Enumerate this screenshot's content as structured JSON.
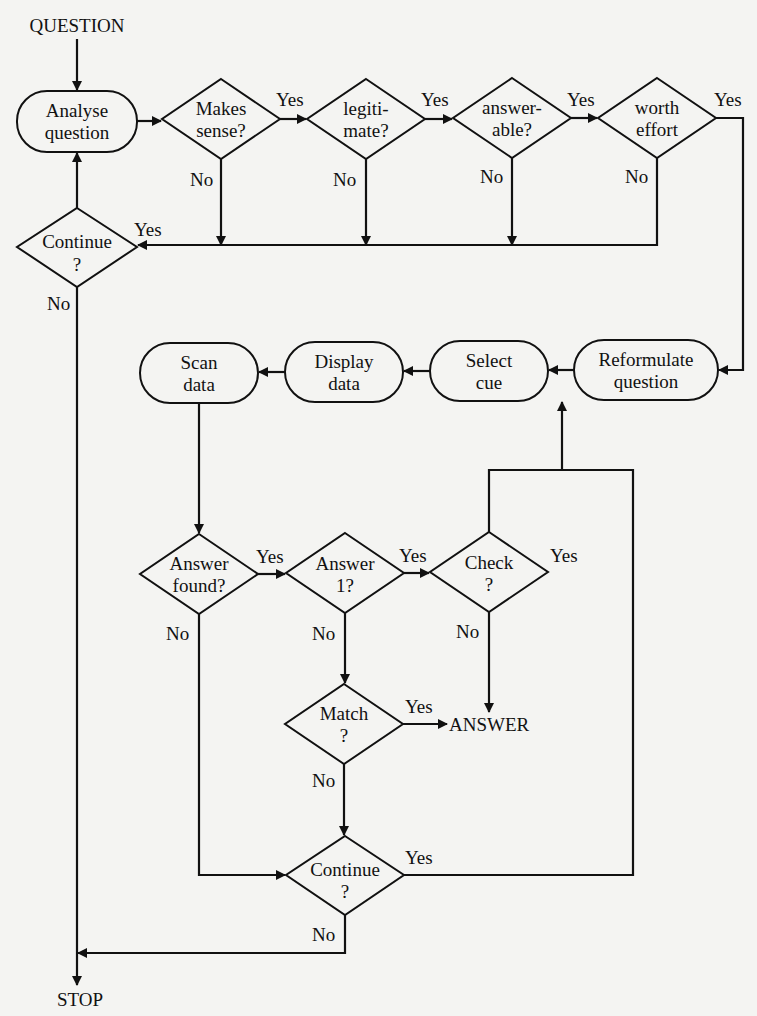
{
  "diagram": {
    "type": "flowchart",
    "terminals": {
      "start": "QUESTION",
      "answer": "ANSWER",
      "stop": "STOP"
    },
    "processes": {
      "analyse": [
        "Analyse",
        "question"
      ],
      "reformulate": [
        "Reformulate",
        "question"
      ],
      "select_cue": [
        "Select",
        "cue"
      ],
      "display_data": [
        "Display",
        "data"
      ],
      "scan_data": [
        "Scan",
        "data"
      ]
    },
    "decisions": {
      "makes_sense": [
        "Makes",
        "sense?"
      ],
      "legitimate": [
        "legiti-",
        "mate?"
      ],
      "answerable": [
        "answer-",
        "able?"
      ],
      "worth_effort": [
        "worth",
        "effort"
      ],
      "continue_top": [
        "Continue",
        "?"
      ],
      "answer_found": [
        "Answer",
        "found?"
      ],
      "answer_1": [
        "Answer",
        "1?"
      ],
      "check": [
        "Check",
        "?"
      ],
      "match": [
        "Match",
        "?"
      ],
      "continue_bottom": [
        "Continue",
        "?"
      ]
    },
    "edge_labels": {
      "yes": "Yes",
      "no": "No"
    }
  }
}
